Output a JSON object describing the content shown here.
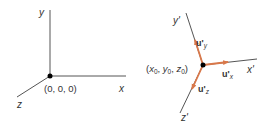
{
  "colors": {
    "axis": "#555555",
    "vector": "#d9784a",
    "dot": "#000000",
    "text": "#333333"
  },
  "left_frame": {
    "axes": {
      "x": "x",
      "y": "y",
      "z": "z"
    },
    "origin_label": "(0, 0, 0)"
  },
  "right_frame": {
    "axes": {
      "x": "x'",
      "y": "y'",
      "z": "z'"
    },
    "origin_label": {
      "open": "(",
      "x": "x",
      "y": "y",
      "z": "z",
      "sub": "0",
      "sep": ", ",
      "close": ")"
    },
    "unit_vectors": {
      "base": "u'",
      "x_sub": "x",
      "y_sub": "y",
      "z_sub": "z"
    }
  }
}
